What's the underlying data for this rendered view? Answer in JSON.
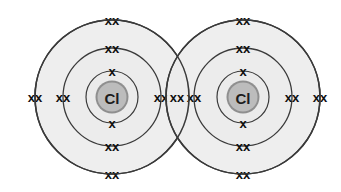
{
  "diagram": {
    "type": "bohr-lewis-dot-cross",
    "background_color": "#ffffff",
    "shell_fill_color": "#ebebeb",
    "shell_stroke_color": "#3a3a3a",
    "nucleus_fill_color": "#bcbcbc",
    "nucleus_ring_color": "#8f8f8f",
    "electron_color": "#101010",
    "electron_glyph": "x",
    "electron_pair_glyph": "xx",
    "atoms": [
      {
        "id": "atom-left",
        "label": "Cl",
        "center_x": 112,
        "center_y": 97,
        "shells": [
          {
            "name": "inner-shell",
            "radius": 26,
            "electrons": 2,
            "groups": [
              "x",
              "x"
            ]
          },
          {
            "name": "middle-shell",
            "radius": 49,
            "electrons": 8,
            "groups": [
              "xx",
              "xx",
              "xx",
              "xx"
            ]
          },
          {
            "name": "outer-shell",
            "radius": 77,
            "electrons": 8,
            "groups": [
              "xx",
              "xx",
              "xx",
              "xx"
            ]
          }
        ]
      },
      {
        "id": "atom-right",
        "label": "Cl",
        "center_x": 243,
        "center_y": 97,
        "shells": [
          {
            "name": "inner-shell",
            "radius": 26,
            "electrons": 2,
            "groups": [
              "x",
              "x"
            ]
          },
          {
            "name": "middle-shell",
            "radius": 49,
            "electrons": 8,
            "groups": [
              "xx",
              "xx",
              "xx",
              "xx"
            ]
          },
          {
            "name": "outer-shell",
            "radius": 77,
            "electrons": 8,
            "groups": [
              "xx",
              "xx",
              "xx",
              "xx"
            ]
          }
        ]
      }
    ],
    "bond": {
      "name": "shared-electron-pair",
      "glyph": "xx",
      "center_x": 177,
      "center_y": 97,
      "description": "single covalent bond shared pair in overlap region"
    },
    "electron_labels": {
      "single": "x",
      "pair": "xx"
    }
  }
}
